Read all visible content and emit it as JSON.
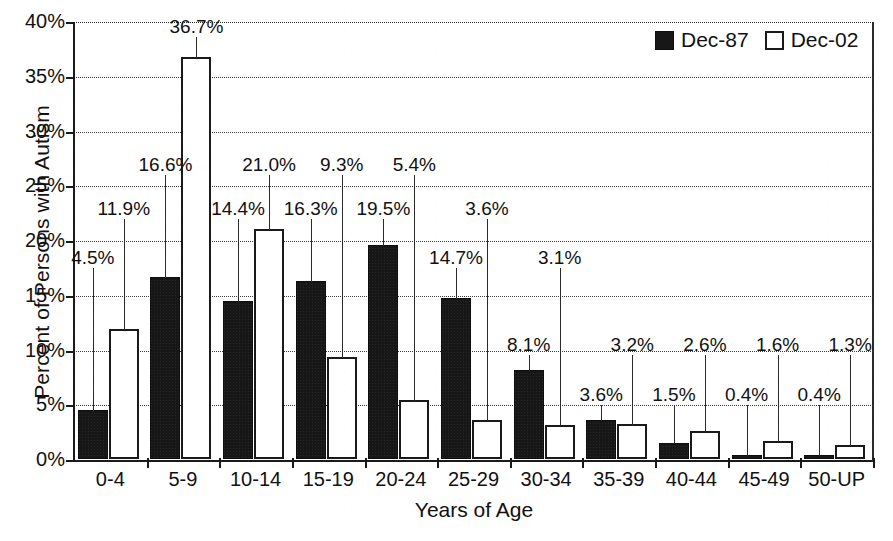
{
  "chart_data": {
    "type": "bar",
    "title": "",
    "xlabel": "Years of Age",
    "ylabel": "Percent of Persons with Autism",
    "ylim": [
      0,
      40
    ],
    "ytick_labels": [
      "0%",
      "5%",
      "10%",
      "15%",
      "20%",
      "25%",
      "30%",
      "35%",
      "40%"
    ],
    "ytick_values": [
      0,
      5,
      10,
      15,
      20,
      25,
      30,
      35,
      40
    ],
    "grid": true,
    "legend_position": "top-right",
    "value_suffix": "%",
    "categories": [
      "0-4",
      "5-9",
      "10-14",
      "15-19",
      "20-24",
      "25-29",
      "30-34",
      "35-39",
      "40-44",
      "45-49",
      "50-UP"
    ],
    "series": [
      {
        "name": "Dec-87",
        "color": "#171717",
        "style": "filled",
        "values": [
          4.5,
          16.6,
          14.4,
          16.3,
          19.5,
          14.7,
          8.1,
          3.6,
          1.5,
          0.4,
          0.4
        ],
        "labels": [
          "4.5%",
          "16.6%",
          "14.4%",
          "16.3%",
          "19.5%",
          "14.7%",
          "8.1%",
          "3.6%",
          "1.5%",
          "0.4%",
          "0.4%"
        ]
      },
      {
        "name": "Dec-02",
        "color": "#ffffff",
        "style": "outlined",
        "values": [
          11.9,
          36.7,
          21.0,
          9.3,
          5.4,
          3.6,
          3.1,
          3.2,
          2.6,
          1.6,
          1.3
        ],
        "labels": [
          "11.9%",
          "36.7%",
          "21.0%",
          "9.3%",
          "5.4%",
          "3.6%",
          "3.1%",
          "3.2%",
          "2.6%",
          "1.6%",
          "1.3%"
        ]
      }
    ],
    "label_anchor_percent": [
      [
        17.5,
        22.0
      ],
      [
        26.0,
        38.6
      ],
      [
        22.0,
        26.0
      ],
      [
        22.0,
        26.0
      ],
      [
        22.0,
        26.0
      ],
      [
        17.5,
        22.0
      ],
      [
        9.6,
        17.5
      ],
      [
        5.0,
        9.6
      ],
      [
        5.0,
        9.6
      ],
      [
        5.0,
        9.6
      ],
      [
        5.0,
        9.6
      ]
    ]
  },
  "legend": {
    "items": [
      {
        "label": "Dec-87",
        "style": "filled"
      },
      {
        "label": "Dec-02",
        "style": "outlined"
      }
    ]
  },
  "axis_titles": {
    "y": "Percent of Persons with Autism",
    "x": "Years of Age"
  }
}
